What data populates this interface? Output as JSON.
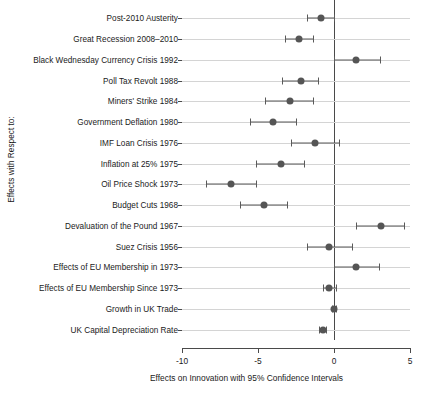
{
  "chart_data": {
    "type": "scatter",
    "title": "",
    "subtitle": "",
    "orientation": "horizontal",
    "xlabel": "Effects on Innovation with 95% Confidence Intervals",
    "ylabel": "Effects with Respect to:",
    "xlim": [
      -10,
      5
    ],
    "xticks": [
      -10,
      -5,
      0,
      5
    ],
    "xticklabels": [
      "-10",
      "-5",
      "0",
      "5"
    ],
    "grid": "horizontal",
    "legend": "none",
    "reference_line": 0,
    "point_color": "#555555",
    "interval_color": "#5a5a5a",
    "grid_color": "#d4d4d4",
    "axis_color": "#4a4a4a",
    "categories": [
      "Post-2010 Austerity",
      "Great Recession 2008–2010",
      "Black Wednesday Currency Crisis 1992",
      "Poll Tax Revolt 1988",
      "Miners' Strike 1984",
      "Government Deflation 1980",
      "IMF Loan Crisis 1976",
      "Inflation at 25% 1975",
      "Oil Price Shock 1973",
      "Budget Cuts 1968",
      "Devaluation of the Pound 1967",
      "Suez Crisis 1956",
      "Effects of EU Membership in 1973",
      "Effects of EU Membership Since 1973",
      "Growth in UK Trade",
      "UK Capital Depreciation Rate"
    ],
    "values": [
      -0.85,
      -2.3,
      1.45,
      -2.2,
      -2.9,
      -4.0,
      -1.25,
      -3.5,
      -6.8,
      -4.6,
      3.1,
      -0.3,
      1.45,
      -0.35,
      0.0,
      -0.75
    ],
    "ci_low": [
      -1.8,
      -3.25,
      0.0,
      -3.4,
      -4.55,
      -5.55,
      -2.8,
      -5.15,
      -8.45,
      -6.2,
      1.45,
      -1.8,
      0.0,
      -0.75,
      -0.1,
      -1.0
    ],
    "ci_high": [
      0.0,
      -1.4,
      3.0,
      -1.05,
      -1.4,
      -2.5,
      0.35,
      -2.0,
      -5.1,
      -3.1,
      4.6,
      1.2,
      2.95,
      0.15,
      0.1,
      -0.5
    ]
  }
}
